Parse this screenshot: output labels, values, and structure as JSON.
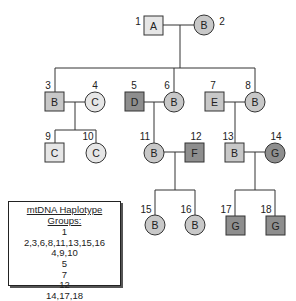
{
  "diagram": {
    "type": "pedigree",
    "colors": {
      "light": "#e6e6e6",
      "medium": "#c8c8c8",
      "dark": "#8e8e8e",
      "line": "#333333"
    },
    "individuals": [
      {
        "id": "1",
        "label": "A",
        "sex": "male",
        "shade": "light"
      },
      {
        "id": "2",
        "label": "B",
        "sex": "female",
        "shade": "medium"
      },
      {
        "id": "3",
        "label": "B",
        "sex": "male",
        "shade": "medium"
      },
      {
        "id": "4",
        "label": "C",
        "sex": "female",
        "shade": "light"
      },
      {
        "id": "5",
        "label": "D",
        "sex": "male",
        "shade": "dark"
      },
      {
        "id": "6",
        "label": "B",
        "sex": "female",
        "shade": "medium"
      },
      {
        "id": "7",
        "label": "E",
        "sex": "male",
        "shade": "medium"
      },
      {
        "id": "8",
        "label": "B",
        "sex": "female",
        "shade": "medium"
      },
      {
        "id": "9",
        "label": "C",
        "sex": "male",
        "shade": "light"
      },
      {
        "id": "10",
        "label": "C",
        "sex": "female",
        "shade": "light"
      },
      {
        "id": "11",
        "label": "B",
        "sex": "female",
        "shade": "medium"
      },
      {
        "id": "12",
        "label": "F",
        "sex": "male",
        "shade": "dark"
      },
      {
        "id": "13",
        "label": "B",
        "sex": "male",
        "shade": "medium"
      },
      {
        "id": "14",
        "label": "G",
        "sex": "female",
        "shade": "dark"
      },
      {
        "id": "15",
        "label": "B",
        "sex": "female",
        "shade": "medium"
      },
      {
        "id": "16",
        "label": "B",
        "sex": "female",
        "shade": "medium"
      },
      {
        "id": "17",
        "label": "G",
        "sex": "male",
        "shade": "dark"
      },
      {
        "id": "18",
        "label": "G",
        "sex": "male",
        "shade": "dark"
      }
    ]
  },
  "legend": {
    "title": "mtDNA Haplotype Groups:",
    "groups": [
      "1",
      "2,3,6,8,11,13,15,16",
      "4,9,10",
      "5",
      "7",
      "12",
      "14,17,18"
    ]
  }
}
